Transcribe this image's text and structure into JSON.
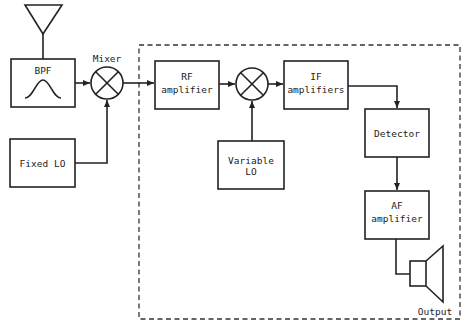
{
  "diagram": {
    "type": "superheterodyne receiver block diagram",
    "blocks": {
      "bpf": {
        "label": "BPF"
      },
      "mixer1": {
        "label": "Mixer"
      },
      "fixed_lo": {
        "label": "Fixed LO"
      },
      "rf_amp": {
        "line1": "RF",
        "line2": "amplifier"
      },
      "if_amp": {
        "line1": "IF",
        "line2": "amplifiers"
      },
      "variable_lo": {
        "line1": "Variable",
        "line2": "LO"
      },
      "detector": {
        "label": "Detector"
      },
      "af_amp": {
        "line1": "AF",
        "line2": "amplifier"
      },
      "output": {
        "label": "Output"
      }
    },
    "connections": [
      [
        "antenna",
        "bpf"
      ],
      [
        "bpf",
        "mixer1"
      ],
      [
        "fixed_lo",
        "mixer1"
      ],
      [
        "mixer1",
        "rf_amp"
      ],
      [
        "rf_amp",
        "mixer2"
      ],
      [
        "variable_lo",
        "mixer2"
      ],
      [
        "mixer2",
        "if_amp"
      ],
      [
        "if_amp",
        "detector"
      ],
      [
        "detector",
        "af_amp"
      ],
      [
        "af_amp",
        "speaker"
      ]
    ]
  }
}
